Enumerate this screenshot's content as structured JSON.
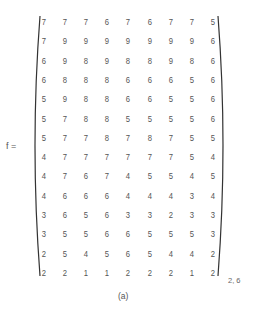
{
  "equation": {
    "lhs": "f =",
    "subscript": "2, 6",
    "caption": "(a)",
    "matrix": [
      [
        7,
        7,
        7,
        6,
        7,
        6,
        7,
        7,
        5
      ],
      [
        7,
        9,
        9,
        9,
        9,
        9,
        9,
        9,
        6
      ],
      [
        6,
        9,
        8,
        9,
        8,
        8,
        9,
        8,
        6
      ],
      [
        6,
        8,
        8,
        8,
        6,
        6,
        6,
        5,
        6
      ],
      [
        5,
        9,
        8,
        8,
        6,
        6,
        5,
        5,
        6
      ],
      [
        5,
        7,
        8,
        8,
        5,
        5,
        5,
        5,
        6
      ],
      [
        5,
        7,
        7,
        8,
        7,
        8,
        7,
        5,
        5
      ],
      [
        4,
        7,
        7,
        7,
        7,
        7,
        7,
        5,
        4
      ],
      [
        4,
        7,
        6,
        7,
        4,
        5,
        5,
        4,
        5
      ],
      [
        4,
        6,
        6,
        6,
        4,
        4,
        4,
        3,
        4
      ],
      [
        3,
        6,
        5,
        6,
        3,
        3,
        2,
        3,
        3
      ],
      [
        3,
        5,
        5,
        6,
        6,
        5,
        5,
        5,
        3
      ],
      [
        2,
        5,
        4,
        5,
        6,
        5,
        4,
        4,
        2
      ],
      [
        2,
        2,
        1,
        1,
        2,
        2,
        2,
        1,
        2
      ]
    ]
  }
}
